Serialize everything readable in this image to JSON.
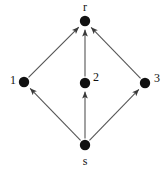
{
  "figure": {
    "name": "directed-graph-diagram",
    "background_color": "#ffffff",
    "node_color": "#111111",
    "edge_color": "#555555",
    "label_color": "#111111",
    "width": 168,
    "height": 170
  },
  "nodes": [
    {
      "id": "r",
      "label": "r",
      "x": 85,
      "y": 21,
      "radius": 5.2,
      "label_x": 85,
      "label_y": 7,
      "label_anchor": "middle"
    },
    {
      "id": "1",
      "label": "1",
      "x": 24,
      "y": 82,
      "radius": 5.2,
      "label_x": 13,
      "label_y": 80,
      "label_anchor": "middle"
    },
    {
      "id": "2",
      "label": "2",
      "x": 85,
      "y": 83,
      "radius": 5.2,
      "label_x": 96,
      "label_y": 77,
      "label_anchor": "middle"
    },
    {
      "id": "3",
      "label": "3",
      "x": 145,
      "y": 83,
      "radius": 5.2,
      "label_x": 157,
      "label_y": 78,
      "label_anchor": "middle"
    },
    {
      "id": "s",
      "label": "s",
      "x": 85,
      "y": 145,
      "radius": 5.2,
      "label_x": 85,
      "label_y": 161,
      "label_anchor": "middle"
    }
  ],
  "edges": [
    {
      "id": "s-to-1",
      "from": "s",
      "to": "1",
      "directed": true
    },
    {
      "id": "s-to-2",
      "from": "s",
      "to": "2",
      "directed": true
    },
    {
      "id": "s-to-3",
      "from": "s",
      "to": "3",
      "directed": true
    },
    {
      "id": "1-to-r",
      "from": "1",
      "to": "r",
      "directed": true
    },
    {
      "id": "2-to-r",
      "from": "2",
      "to": "r",
      "directed": true
    },
    {
      "id": "3-to-r",
      "from": "3",
      "to": "r",
      "directed": true
    }
  ]
}
